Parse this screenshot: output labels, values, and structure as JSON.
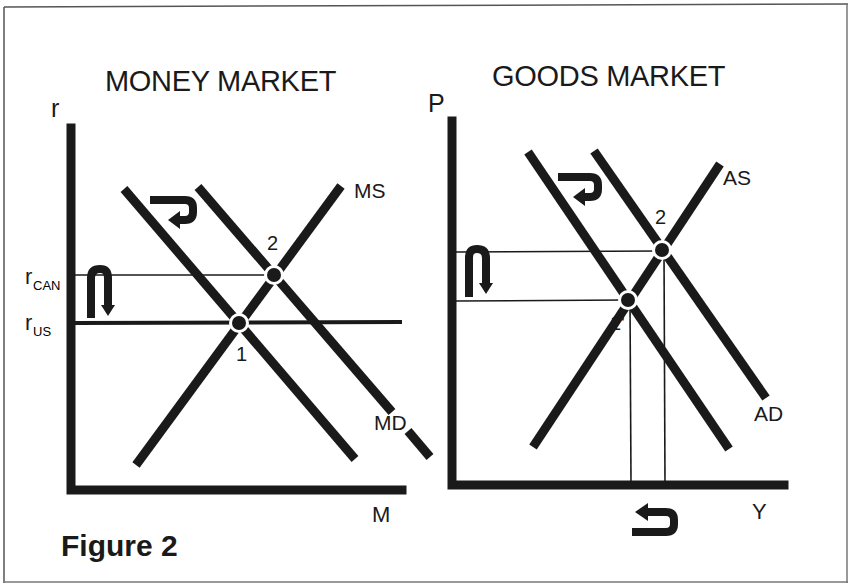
{
  "figure": {
    "caption": "Figure 2",
    "frame_color": "#555555",
    "ink_color": "#1a1a1a"
  },
  "money_market": {
    "title": "MONEY MARKET",
    "y_axis_label": "r",
    "x_axis_label": "M",
    "curves": {
      "supply": "MS",
      "demand": "MD"
    },
    "rate_labels": {
      "r_can_main": "r",
      "r_can_sub": "CAN",
      "r_us_main": "r",
      "r_us_sub": "US"
    },
    "points": {
      "p1": "1",
      "p2": "2"
    },
    "arrows": {
      "demand_shift": "shift-right-then-back-left",
      "rate_change": "down"
    }
  },
  "goods_market": {
    "title": "GOODS MARKET",
    "y_axis_label": "P",
    "x_axis_label": "Y",
    "curves": {
      "supply": "AS",
      "demand": "AD"
    },
    "points": {
      "p1": "1'",
      "p2": "2"
    },
    "arrows": {
      "demand_shift": "shift-right-then-back-left",
      "price_change": "down",
      "output_change": "left"
    }
  }
}
